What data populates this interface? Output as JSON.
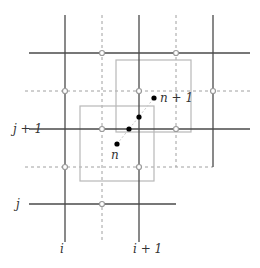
{
  "diagram": {
    "colors": {
      "solid_line": "#4a4a4a",
      "dashed_line": "#a0a0a0",
      "box": "#b8b8b8",
      "node": "#9a9a9a",
      "particle": "#000000",
      "trajectory": "#c8c8c8",
      "label": "#333333"
    },
    "labels": {
      "row_j": "j",
      "row_j_plus_1": "j + 1",
      "col_i": "i",
      "col_i_plus_1": "i + 1",
      "particle_start": "n",
      "particle_end": "n + 1"
    },
    "particles": [
      {
        "name": "particle-n",
        "label": "n"
      },
      {
        "name": "particle-intermediate-1",
        "label": ""
      },
      {
        "name": "particle-intermediate-2",
        "label": ""
      },
      {
        "name": "particle-n-plus-1",
        "label": "n + 1"
      }
    ],
    "boxes": [
      {
        "name": "interpolation-box-n",
        "role": "stencil at step n"
      },
      {
        "name": "interpolation-box-n-plus-1",
        "role": "stencil at step n+1"
      }
    ]
  }
}
